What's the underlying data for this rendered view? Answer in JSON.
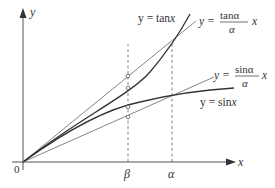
{
  "figure": {
    "axes": {
      "x_label": "x",
      "y_label": "y",
      "origin_label": "0"
    },
    "ticks": {
      "beta": "β",
      "alpha": "α"
    },
    "curves": {
      "tan": {
        "label_prefix": "y = tan",
        "label_var": "x"
      },
      "sin": {
        "label_prefix": "y = sin",
        "label_var": "x"
      },
      "tan_line": {
        "label_prefix": "y =",
        "numerator": "tanα",
        "denominator": "α",
        "label_var": "x"
      },
      "sin_line": {
        "label_prefix": "y =",
        "numerator": "sinα",
        "denominator": "α",
        "label_var": "x"
      }
    },
    "colors": {
      "axis": "#555555",
      "curve": "#333333",
      "line": "#777777",
      "dash": "#666666"
    }
  }
}
